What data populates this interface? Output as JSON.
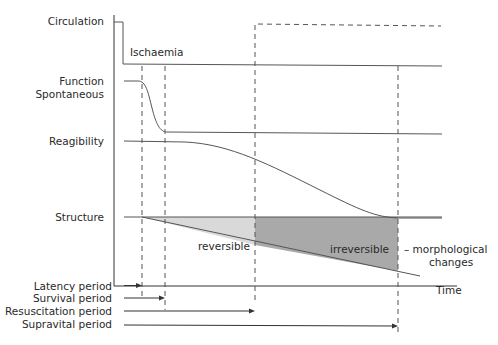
{
  "diagram": {
    "row_labels": {
      "circulation": "Circulation",
      "function_line1": "Function",
      "function_line2": "Spontaneous",
      "reagibility": "Reagibility",
      "structure": "Structure"
    },
    "annotations": {
      "ischaemia": "Ischaemia",
      "reversible": "reversible",
      "irreversible": "irreversible",
      "morphological_line1": "– morphological",
      "morphological_line2": "changes"
    },
    "x_axis_label": "Time",
    "periods": [
      {
        "label": "Latency period"
      },
      {
        "label": "Survival period"
      },
      {
        "label": "Resuscitation period"
      },
      {
        "label": "Supravital period"
      }
    ],
    "colors": {
      "reversible_fill": "#d9d9d9",
      "irreversible_fill": "#a9a9a9",
      "line": "#555555"
    }
  }
}
